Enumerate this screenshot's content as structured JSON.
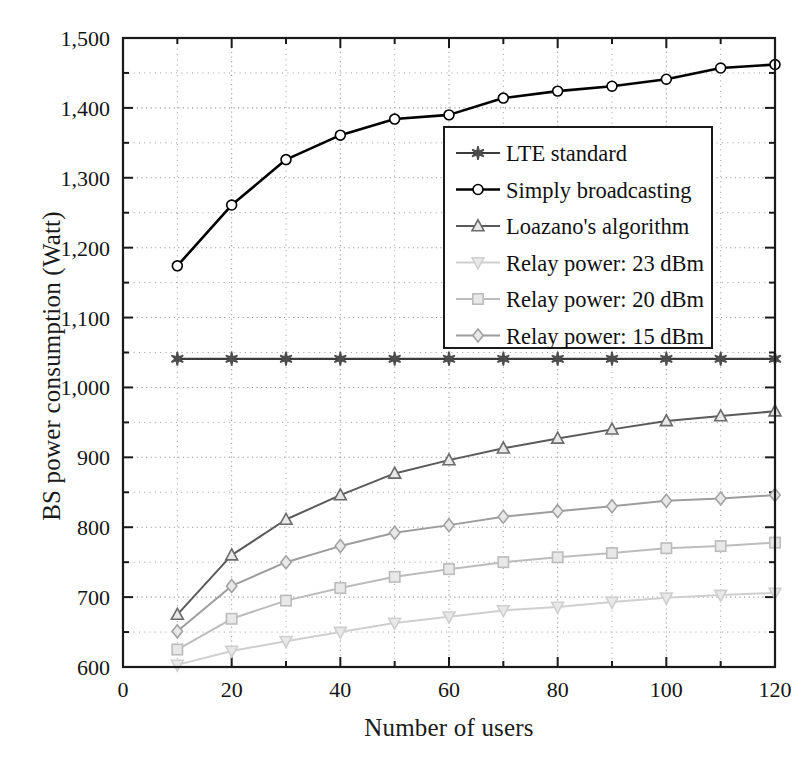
{
  "chart_data": {
    "type": "line",
    "title": "",
    "xlabel": "Number of users",
    "ylabel": "BS power consumption (Watt)",
    "xlim": [
      0,
      120
    ],
    "ylim": [
      600,
      1500
    ],
    "xticks": [
      0,
      20,
      40,
      60,
      80,
      100,
      120
    ],
    "xtick_labels": [
      "0",
      "20",
      "40",
      "60",
      "80",
      "100",
      "120"
    ],
    "xminor_step": 10,
    "yticks": [
      600,
      700,
      800,
      900,
      1000,
      1100,
      1200,
      1300,
      1400,
      1500
    ],
    "ytick_labels": [
      "600",
      "700",
      "800",
      "900",
      "1,000",
      "1,100",
      "1,200",
      "1,300",
      "1,400",
      "1,500"
    ],
    "yminor_step": 50,
    "grid": true,
    "grid_style": "dotted",
    "legend_position": "upper-right-inside",
    "x": [
      10,
      20,
      30,
      40,
      50,
      60,
      70,
      80,
      90,
      100,
      110,
      120
    ],
    "series": [
      {
        "name": "LTE standard",
        "marker": "star",
        "color": "#4d4d4d",
        "line_color": "#3c3c3c",
        "values": [
          1041,
          1041,
          1041,
          1041,
          1041,
          1041,
          1041,
          1041,
          1041,
          1041,
          1041,
          1041
        ]
      },
      {
        "name": "Simply broadcasting",
        "marker": "circle",
        "color": "#000000",
        "line_color": "#000000",
        "values": [
          1174,
          1261,
          1326,
          1361,
          1384,
          1390,
          1414,
          1424,
          1431,
          1441,
          1457,
          1462
        ]
      },
      {
        "name": "Loazano's algorithm",
        "marker": "triangle-up",
        "color": "#6b6b6b",
        "line_color": "#5a5a5a",
        "values": [
          675,
          760,
          811,
          846,
          877,
          896,
          913,
          927,
          940,
          952,
          959,
          966
        ]
      },
      {
        "name": "Relay power: 23 dBm",
        "marker": "triangle-down",
        "color": "#cfcfcf",
        "line_color": "#cfcfcf",
        "values": [
          603,
          623,
          637,
          650,
          663,
          672,
          681,
          686,
          693,
          699,
          703,
          706
        ]
      },
      {
        "name": "Relay power: 20 dBm",
        "marker": "square",
        "color": "#bcbcbc",
        "line_color": "#bcbcbc",
        "values": [
          625,
          669,
          695,
          713,
          729,
          740,
          750,
          757,
          763,
          770,
          773,
          778
        ]
      },
      {
        "name": "Relay power: 15 dBm",
        "marker": "diamond",
        "color": "#a3a3a3",
        "line_color": "#9d9d9d",
        "values": [
          651,
          716,
          750,
          773,
          792,
          803,
          815,
          823,
          830,
          838,
          841,
          846
        ]
      }
    ]
  },
  "legend": {
    "items": [
      "LTE standard",
      "Simply broadcasting",
      "Loazano's algorithm",
      "Relay power: 23 dBm",
      "Relay power: 20 dBm",
      "Relay power: 15 dBm"
    ]
  },
  "axes": {
    "frame_color": "#1a1a1a",
    "grid_color": "#9a9a9a"
  }
}
